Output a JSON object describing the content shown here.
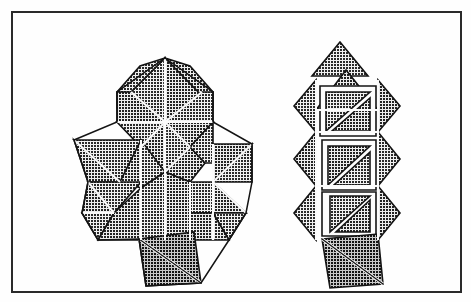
{
  "document": {
    "title": "Tangram Trees Figure",
    "kind": "scanned-line-art-illustration",
    "width": 471,
    "height": 302,
    "visible_text": "",
    "background_color": "#fefefe",
    "ink_color": "#1a1a1a",
    "fill_pattern": "crosshatch-grid",
    "pattern_density": "fine"
  },
  "frame": {
    "name": "border-rectangle",
    "x": 11,
    "y": 11,
    "width": 451,
    "height": 282,
    "stroke_color": "#2a2a2a",
    "stroke_width": 2,
    "fill": "none"
  },
  "figures": [
    {
      "id": "left-tree",
      "label": "tangram-tree-dense",
      "description": "Christmas-tree silhouette assembled from crosshatched triangular tangram pieces with a square trunk",
      "piece_count": 22,
      "bounds": {
        "x": 74,
        "y": 57,
        "width": 180,
        "height": 229
      },
      "sections": [
        "crown-diamond",
        "upper-branch-row",
        "lower-branch-row",
        "trunk-square"
      ]
    },
    {
      "id": "right-tree",
      "label": "tangram-tree-sparse",
      "description": "Narrow tree silhouette of stacked diamonds, triangles and outlined squares with diagonals",
      "piece_count": 16,
      "bounds": {
        "x": 294,
        "y": 42,
        "width": 106,
        "height": 244
      },
      "sections": [
        "apex-triangle",
        "upper-diamond-band",
        "middle-diamond-band",
        "lower-diamond-band",
        "trunk-quadrilateral"
      ]
    }
  ],
  "style": {
    "line_color": "#141414",
    "line_width": 1.6,
    "highlight_gap_color": "#fdfdfd",
    "pattern_fg": "#111111",
    "pattern_bg": "#e9e9e9",
    "shadow_tint": "#cfcfcf"
  }
}
